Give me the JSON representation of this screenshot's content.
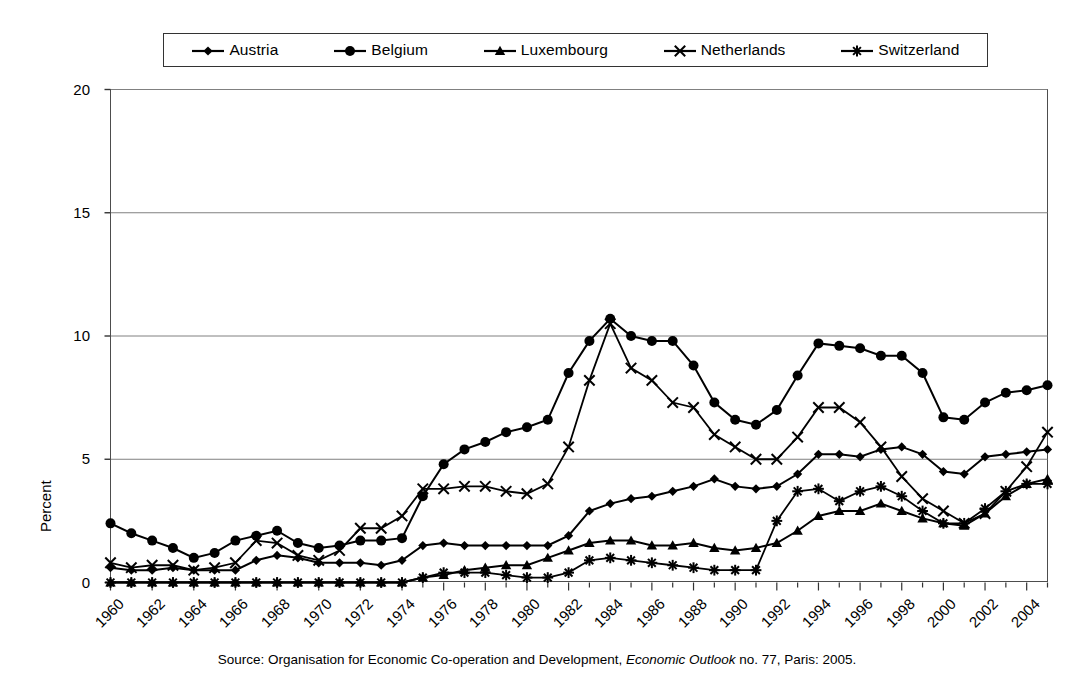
{
  "chart_data": {
    "type": "line",
    "title": "",
    "xlabel": "",
    "ylabel": "Percent",
    "ylim": [
      0,
      20
    ],
    "yticks": [
      0,
      5,
      10,
      15,
      20
    ],
    "xlim": [
      1960,
      2005
    ],
    "xticks": [
      1960,
      1962,
      1964,
      1966,
      1968,
      1970,
      1972,
      1974,
      1976,
      1978,
      1980,
      1982,
      1984,
      1986,
      1988,
      1990,
      1992,
      1994,
      1996,
      1998,
      2000,
      2002,
      2004
    ],
    "grid": "horizontal",
    "legend_position": "top",
    "x": [
      1960,
      1961,
      1962,
      1963,
      1964,
      1965,
      1966,
      1967,
      1968,
      1969,
      1970,
      1971,
      1972,
      1973,
      1974,
      1975,
      1976,
      1977,
      1978,
      1979,
      1980,
      1981,
      1982,
      1983,
      1984,
      1985,
      1986,
      1987,
      1988,
      1989,
      1990,
      1991,
      1992,
      1993,
      1994,
      1995,
      1996,
      1997,
      1998,
      1999,
      2000,
      2001,
      2002,
      2003,
      2004,
      2005
    ],
    "series": [
      {
        "name": "Austria",
        "marker": "diamond",
        "values": [
          0.6,
          0.5,
          0.5,
          0.6,
          0.5,
          0.5,
          0.5,
          0.9,
          1.1,
          1.0,
          0.8,
          0.8,
          0.8,
          0.7,
          0.9,
          1.5,
          1.6,
          1.5,
          1.5,
          1.5,
          1.5,
          1.5,
          1.9,
          2.9,
          3.2,
          3.4,
          3.5,
          3.7,
          3.9,
          4.2,
          3.9,
          3.8,
          3.9,
          4.4,
          5.2,
          5.2,
          5.1,
          5.4,
          5.5,
          5.2,
          4.5,
          4.4,
          5.1,
          5.2,
          5.3,
          5.4
        ]
      },
      {
        "name": "Belgium",
        "marker": "circle",
        "values": [
          2.4,
          2.0,
          1.7,
          1.4,
          1.0,
          1.2,
          1.7,
          1.9,
          2.1,
          1.6,
          1.4,
          1.5,
          1.7,
          1.7,
          1.8,
          3.5,
          4.8,
          5.4,
          5.7,
          6.1,
          6.3,
          6.6,
          8.5,
          9.8,
          10.7,
          10.0,
          9.8,
          9.8,
          8.8,
          7.3,
          6.6,
          6.4,
          7.0,
          8.4,
          9.7,
          9.6,
          9.5,
          9.2,
          9.2,
          8.5,
          6.7,
          6.6,
          7.3,
          7.7,
          7.8,
          8.0
        ]
      },
      {
        "name": "Luxembourg",
        "marker": "triangle",
        "values": [
          0.0,
          0.0,
          0.0,
          0.0,
          0.0,
          0.0,
          0.0,
          0.0,
          0.0,
          0.0,
          0.0,
          0.0,
          0.0,
          0.0,
          0.0,
          0.2,
          0.3,
          0.5,
          0.6,
          0.7,
          0.7,
          1.0,
          1.3,
          1.6,
          1.7,
          1.7,
          1.5,
          1.5,
          1.6,
          1.4,
          1.3,
          1.4,
          1.6,
          2.1,
          2.7,
          2.9,
          2.9,
          3.2,
          2.9,
          2.6,
          2.4,
          2.3,
          2.8,
          3.5,
          4.0,
          4.2
        ]
      },
      {
        "name": "Netherlands",
        "marker": "x",
        "values": [
          0.8,
          0.6,
          0.7,
          0.7,
          0.5,
          0.6,
          0.8,
          1.7,
          1.6,
          1.1,
          0.9,
          1.3,
          2.2,
          2.2,
          2.7,
          3.8,
          3.8,
          3.9,
          3.9,
          3.7,
          3.6,
          4.0,
          5.5,
          8.2,
          10.5,
          8.7,
          8.2,
          7.3,
          7.1,
          6.0,
          5.5,
          5.0,
          5.0,
          5.9,
          7.1,
          7.1,
          6.5,
          5.5,
          4.3,
          3.4,
          2.9,
          2.4,
          2.8,
          3.7,
          4.7,
          6.1
        ]
      },
      {
        "name": "Switzerland",
        "marker": "asterisk",
        "values": [
          0.0,
          0.0,
          0.0,
          0.0,
          0.0,
          0.0,
          0.0,
          0.0,
          0.0,
          0.0,
          0.0,
          0.0,
          0.0,
          0.0,
          0.0,
          0.2,
          0.4,
          0.4,
          0.4,
          0.3,
          0.2,
          0.2,
          0.4,
          0.9,
          1.0,
          0.9,
          0.8,
          0.7,
          0.6,
          0.5,
          0.5,
          0.5,
          2.5,
          3.7,
          3.8,
          3.3,
          3.7,
          3.9,
          3.5,
          2.9,
          2.4,
          2.4,
          3.0,
          3.7,
          4.0,
          4.0
        ]
      }
    ]
  },
  "legend": {
    "entries": [
      {
        "label": "Austria",
        "marker": "diamond"
      },
      {
        "label": "Belgium",
        "marker": "circle"
      },
      {
        "label": "Luxembourg",
        "marker": "triangle"
      },
      {
        "label": "Netherlands",
        "marker": "x"
      },
      {
        "label": "Switzerland",
        "marker": "asterisk"
      }
    ]
  },
  "axes": {
    "y_title": "Percent",
    "y_tick_labels": [
      "20",
      "15",
      "10",
      "5",
      "0"
    ],
    "x_tick_labels": [
      "1960",
      "1962",
      "1964",
      "1966",
      "1968",
      "1970",
      "1972",
      "1974",
      "1976",
      "1978",
      "1980",
      "1982",
      "1984",
      "1986",
      "1988",
      "1990",
      "1992",
      "1994",
      "1996",
      "1998",
      "2000",
      "2002",
      "2004"
    ]
  },
  "source": {
    "prefix": "Source: Organisation for Economic Co-operation and Development, ",
    "italic": "Economic Outlook",
    "suffix": " no. 77, Paris: 2005."
  },
  "colors": {
    "series_color": "#000000",
    "grid": "#808080",
    "frame": "#4d4d4d",
    "background": "#ffffff"
  }
}
